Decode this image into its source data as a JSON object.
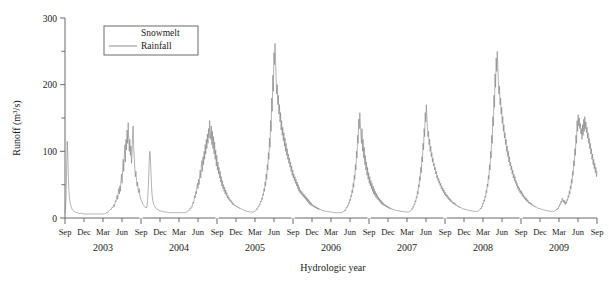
{
  "chart_data": {
    "type": "line",
    "title": "",
    "xlabel": "Hydrologic year",
    "ylabel": "Runoff (m³/s)",
    "ylabel_parts": {
      "pre": "Runoff (m",
      "sup": "3",
      "post": "/s)"
    },
    "ylim": [
      0,
      300
    ],
    "yticks_major": [
      0,
      100,
      200,
      300
    ],
    "yticks_minor": [
      50,
      150,
      250
    ],
    "ytick_labels": [
      "0",
      "100",
      "200",
      "300"
    ],
    "grid": false,
    "x_tick_labels": [
      "Sep",
      "Dec",
      "Mar",
      "Jun",
      "Sep",
      "Dec",
      "Mar",
      "Jun",
      "Sep",
      "Dec",
      "Mar",
      "Jun",
      "Sep",
      "Dec",
      "Mar",
      "Jun",
      "Sep",
      "Dec",
      "Mar",
      "Jun",
      "Sep",
      "Dec",
      "Mar",
      "Jun",
      "Sep",
      "Dec",
      "Mar",
      "Jun",
      "Sep"
    ],
    "year_labels": [
      "2003",
      "2004",
      "2005",
      "2006",
      "2007",
      "2008",
      "2009"
    ],
    "legend": {
      "position": "top-left-inside",
      "entries": [
        {
          "name": "Snowmelt",
          "color": "#ffffff",
          "has_line_sample": false
        },
        {
          "name": "Rainfall",
          "color": "#808080",
          "has_line_sample": true
        }
      ]
    },
    "series": [
      {
        "name": "Rainfall",
        "color": "#808080",
        "units": "m3/s",
        "annual_peaks": [
          {
            "year": "2002-fall",
            "peak": 115
          },
          {
            "year": "2003",
            "peak": 143
          },
          {
            "year": "2004",
            "peak": 146
          },
          {
            "year": "2005",
            "peak": 262
          },
          {
            "year": "2006",
            "peak": 158
          },
          {
            "year": "2007",
            "peak": 170
          },
          {
            "year": "2008",
            "peak": 250
          },
          {
            "year": "2009",
            "peak": 155
          }
        ],
        "baseflow": 5,
        "values": [
          8,
          14,
          34,
          78,
          115,
          96,
          62,
          41,
          30,
          24,
          20,
          17,
          15,
          13,
          12,
          11,
          10,
          10,
          9,
          9,
          8,
          8,
          8,
          8,
          7,
          7,
          7,
          7,
          7,
          7,
          7,
          7,
          6,
          6,
          6,
          6,
          6,
          6,
          6,
          6,
          6,
          6,
          6,
          6,
          6,
          6,
          6,
          6,
          6,
          6,
          6,
          6,
          6,
          6,
          6,
          6,
          6,
          6,
          6,
          6,
          6,
          6,
          6,
          6,
          6,
          6,
          6,
          6,
          6,
          6,
          6,
          6,
          7,
          7,
          7,
          8,
          8,
          9,
          9,
          10,
          11,
          12,
          13,
          12,
          14,
          16,
          15,
          18,
          20,
          17,
          22,
          26,
          24,
          30,
          34,
          28,
          38,
          44,
          36,
          48,
          40,
          56,
          66,
          52,
          72,
          88,
          70,
          96,
          110,
          84,
          118,
          102,
          132,
          112,
          143,
          120,
          100,
          118,
          94,
          108,
          82,
          96,
          130,
          138,
          104,
          90,
          74,
          62,
          70,
          56,
          48,
          54,
          42,
          38,
          44,
          34,
          30,
          28,
          26,
          24,
          22,
          20,
          19,
          18,
          17,
          16,
          16,
          15,
          18,
          26,
          40,
          62,
          86,
          100,
          92,
          70,
          50,
          36,
          28,
          24,
          21,
          19,
          17,
          16,
          15,
          14,
          13,
          13,
          12,
          12,
          11,
          11,
          11,
          10,
          10,
          10,
          10,
          10,
          9,
          9,
          9,
          9,
          9,
          9,
          9,
          9,
          8,
          8,
          8,
          8,
          8,
          8,
          8,
          8,
          8,
          8,
          8,
          8,
          8,
          8,
          8,
          8,
          8,
          8,
          8,
          8,
          8,
          8,
          8,
          8,
          8,
          8,
          8,
          8,
          8,
          8,
          8,
          8,
          8,
          9,
          9,
          10,
          11,
          12,
          11,
          13,
          15,
          14,
          17,
          16,
          20,
          24,
          22,
          28,
          34,
          30,
          40,
          36,
          46,
          52,
          44,
          58,
          50,
          64,
          72,
          60,
          78,
          86,
          70,
          92,
          80,
          100,
          88,
          110,
          96,
          118,
          104,
          126,
          112,
          134,
          120,
          146,
          128,
          118,
          138,
          110,
          130,
          104,
          122,
          96,
          114,
          88,
          102,
          78,
          94,
          72,
          84,
          66,
          76,
          60,
          70,
          54,
          62,
          48,
          56,
          44,
          50,
          40,
          46,
          36,
          42,
          34,
          38,
          30,
          34,
          28,
          31,
          26,
          28,
          24,
          26,
          22,
          24,
          20,
          22,
          19,
          20,
          18,
          19,
          17,
          18,
          16,
          17,
          15,
          16,
          14,
          15,
          14,
          14,
          13,
          13,
          12,
          12,
          12,
          11,
          11,
          11,
          10,
          10,
          10,
          10,
          10,
          9,
          9,
          9,
          9,
          9,
          9,
          9,
          9,
          9,
          9,
          10,
          10,
          11,
          12,
          14,
          13,
          16,
          18,
          17,
          21,
          20,
          25,
          24,
          30,
          28,
          36,
          34,
          44,
          40,
          54,
          48,
          66,
          58,
          80,
          72,
          98,
          88,
          120,
          106,
          146,
          130,
          180,
          160,
          214,
          190,
          248,
          230,
          262,
          238,
          210,
          186,
          200,
          170,
          184,
          156,
          170,
          144,
          158,
          132,
          146,
          124,
          136,
          116,
          128,
          108,
          120,
          100,
          112,
          94,
          104,
          88,
          96,
          82,
          90,
          76,
          84,
          70,
          78,
          64,
          72,
          60,
          66,
          56,
          62,
          52,
          58,
          48,
          54,
          44,
          50,
          40,
          46,
          38,
          42,
          36,
          40,
          34,
          38,
          32,
          36,
          30,
          34,
          28,
          32,
          26,
          30,
          24,
          28,
          22,
          26,
          20,
          24,
          19,
          22,
          18,
          20,
          17,
          19,
          16,
          18,
          15,
          17,
          14,
          16,
          13,
          15,
          13,
          14,
          12,
          13,
          12,
          12,
          11,
          12,
          11,
          11,
          10,
          11,
          10,
          10,
          10,
          10,
          9,
          10,
          9,
          9,
          9,
          9,
          9,
          9,
          9,
          9,
          8,
          9,
          8,
          8,
          8,
          8,
          8,
          8,
          8,
          8,
          8,
          8,
          8,
          8,
          8,
          8,
          8,
          9,
          9,
          10,
          10,
          12,
          11,
          14,
          16,
          15,
          19,
          18,
          23,
          22,
          28,
          26,
          34,
          32,
          42,
          38,
          52,
          46,
          64,
          58,
          80,
          72,
          100,
          90,
          124,
          112,
          148,
          134,
          158,
          140,
          126,
          112,
          134,
          100,
          118,
          90,
          106,
          80,
          94,
          72,
          84,
          64,
          76,
          58,
          68,
          52,
          62,
          48,
          56,
          44,
          52,
          40,
          48,
          36,
          44,
          34,
          40,
          31,
          37,
          29,
          34,
          27,
          31,
          25,
          29,
          23,
          27,
          21,
          25,
          20,
          23,
          19,
          21,
          18,
          20,
          17,
          19,
          16,
          18,
          15,
          17,
          14,
          16,
          14,
          15,
          13,
          14,
          13,
          13,
          12,
          13,
          12,
          12,
          11,
          12,
          11,
          11,
          11,
          11,
          10,
          11,
          10,
          10,
          10,
          10,
          10,
          10,
          9,
          10,
          9,
          9,
          9,
          9,
          9,
          9,
          9,
          9,
          9,
          10,
          10,
          11,
          12,
          14,
          13,
          17,
          16,
          21,
          20,
          26,
          24,
          32,
          30,
          40,
          36,
          50,
          46,
          62,
          56,
          76,
          68,
          92,
          84,
          112,
          102,
          134,
          122,
          158,
          144,
          170,
          152,
          136,
          122,
          130,
          110,
          118,
          100,
          108,
          92,
          98,
          84,
          90,
          78,
          82,
          72,
          76,
          66,
          70,
          60,
          64,
          56,
          60,
          52,
          56,
          48,
          52,
          44,
          48,
          41,
          45,
          38,
          42,
          35,
          39,
          33,
          36,
          31,
          34,
          29,
          32,
          27,
          30,
          25,
          28,
          24,
          26,
          22,
          24,
          21,
          23,
          20,
          22,
          19,
          20,
          18,
          19,
          17,
          18,
          16,
          17,
          15,
          16,
          15,
          15,
          14,
          14,
          13,
          14,
          13,
          13,
          12,
          13,
          12,
          12,
          12,
          12,
          11,
          11,
          11,
          11,
          11,
          11,
          10,
          11,
          10,
          10,
          10,
          10,
          10,
          10,
          10,
          10,
          10,
          11,
          11,
          12,
          13,
          15,
          14,
          18,
          17,
          22,
          21,
          27,
          25,
          33,
          31,
          41,
          38,
          51,
          47,
          64,
          58,
          80,
          72,
          100,
          90,
          124,
          112,
          152,
          138,
          184,
          166,
          216,
          196,
          240,
          220,
          250,
          228,
          206,
          186,
          198,
          170,
          180,
          156,
          166,
          142,
          152,
          130,
          140,
          120,
          128,
          110,
          118,
          100,
          108,
          92,
          100,
          84,
          92,
          78,
          84,
          72,
          78,
          66,
          72,
          60,
          66,
          56,
          62,
          52,
          56,
          48,
          52,
          44,
          48,
          41,
          45,
          38,
          42,
          36,
          40,
          33,
          37,
          31,
          34,
          29,
          32,
          27,
          30,
          25,
          28,
          24,
          26,
          22,
          24,
          21,
          23,
          20,
          22,
          19,
          20,
          18,
          19,
          17,
          18,
          16,
          17,
          16,
          16,
          15,
          15,
          14,
          15,
          14,
          14,
          13,
          13,
          13,
          13,
          12,
          12,
          12,
          12,
          11,
          12,
          11,
          11,
          11,
          11,
          10,
          11,
          10,
          10,
          10,
          10,
          10,
          10,
          10,
          10,
          10,
          11,
          11,
          12,
          13,
          12,
          15,
          14,
          18,
          17,
          21,
          20,
          25,
          23,
          30,
          28,
          24,
          27,
          22,
          26,
          20,
          24,
          22,
          28,
          26,
          34,
          31,
          40,
          36,
          48,
          44,
          58,
          52,
          70,
          64,
          86,
          78,
          104,
          94,
          124,
          112,
          146,
          130,
          155,
          138,
          150,
          134,
          142,
          126,
          134,
          118,
          140,
          124,
          148,
          130,
          152,
          134,
          144,
          128,
          136,
          120,
          128,
          112,
          120,
          104,
          112,
          96,
          104,
          88,
          96,
          80,
          88,
          74,
          82,
          68,
          76,
          62,
          70
        ]
      }
    ]
  },
  "figure": {
    "background": "#ffffff",
    "line_color": "#808080",
    "axis_color": "#6b6b6b",
    "text_color": "#1a1a1a"
  }
}
